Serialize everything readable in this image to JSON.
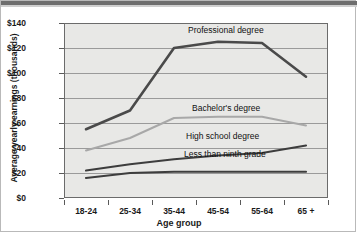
{
  "chart_data": {
    "type": "line",
    "title": "",
    "xlabel": "Age group",
    "ylabel": "Average yearly earnings (thousands)",
    "categories": [
      "18-24",
      "25-34",
      "35-44",
      "45-54",
      "55-64",
      "65 +"
    ],
    "ytick_labels": [
      "$140",
      "$120",
      "$100",
      "$80",
      "$60",
      "$40",
      "$20",
      "$0"
    ],
    "ytick_values": [
      140,
      120,
      100,
      80,
      60,
      40,
      20,
      0
    ],
    "ylim": [
      0,
      140
    ],
    "grid": true,
    "legend": "inline-labels",
    "series": [
      {
        "name": "Professional degree",
        "values": [
          55,
          70,
          120,
          125,
          124,
          97
        ],
        "color": "#4a4a4a",
        "width": 2.6
      },
      {
        "name": "Bachelor's degree",
        "values": [
          38,
          48,
          64,
          65,
          65,
          58
        ],
        "color": "#a8a8a8",
        "width": 2.0
      },
      {
        "name": "High school degree",
        "values": [
          22,
          27,
          31,
          34,
          36,
          42
        ],
        "color": "#3d3d3d",
        "width": 2.2
      },
      {
        "name": "Less than ninth grade",
        "values": [
          16,
          20,
          21,
          21,
          21,
          21
        ],
        "color": "#3d3d3d",
        "width": 2.2
      }
    ]
  },
  "axis": {
    "y_title": "Average yearly earnings (thousands)",
    "x_title": "Age group"
  },
  "labels": {
    "professional": "Professional degree",
    "bachelors": "Bachelor's degree",
    "highschool": "High school degree",
    "ninthgrade": "Less than ninth grade"
  },
  "colors": {
    "plot_background": "#e8e8e6",
    "plot_border": "#6b6b6b",
    "gridline": "#9a9a9a",
    "page_background": "#ffffff",
    "text": "#1a1a1a"
  }
}
